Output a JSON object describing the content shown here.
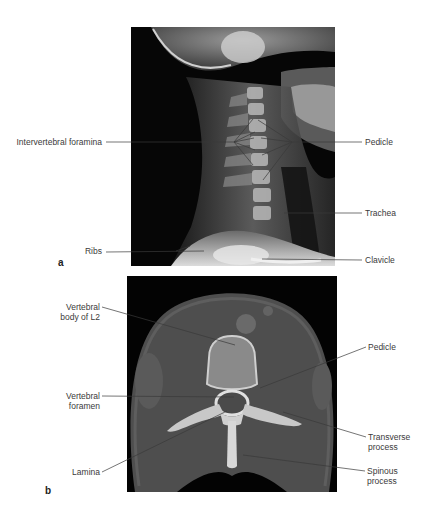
{
  "figure": {
    "panels": [
      {
        "letter": "a",
        "modality": "Lateral cervical spine radiograph",
        "labels": {
          "intervertebral_foramina": "Intervertebral foramina",
          "pedicle": "Pedicle",
          "trachea": "Trachea",
          "ribs": "Ribs",
          "clavicle": "Clavicle"
        }
      },
      {
        "letter": "b",
        "modality": "Axial CT of lumbar vertebra",
        "labels": {
          "vertebral_body_line1": "Vertebral",
          "vertebral_body_line2": "body of L2",
          "vertebral_foramen_line1": "Vertebral",
          "vertebral_foramen_line2": "foramen",
          "lamina": "Lamina",
          "pedicle": "Pedicle",
          "transverse_process_line1": "Transverse",
          "transverse_process_line2": "process",
          "spinous_process_line1": "Spinous",
          "spinous_process_line2": "process"
        }
      }
    ]
  }
}
